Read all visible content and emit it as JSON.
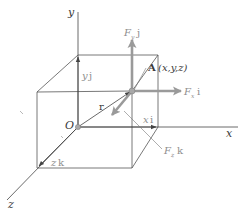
{
  "figure": {
    "axes": {
      "x_label": "x",
      "y_label": "y",
      "z_label": "z",
      "origin_label": "O"
    },
    "vectors": {
      "position_label": "r",
      "x_component": {
        "sym": "x",
        "unit": "i"
      },
      "y_component": {
        "sym": "y",
        "unit": "j"
      },
      "z_component": {
        "sym": "z",
        "unit": "k"
      }
    },
    "forces": {
      "fx": {
        "sym": "F",
        "sub": "x",
        "unit": "i"
      },
      "fy": {
        "sym": "F",
        "sub": "y",
        "unit": "j"
      },
      "fz": {
        "sym": "F",
        "sub": "z",
        "unit": "k"
      }
    },
    "point": {
      "name": "A",
      "coords": "(x,y,z)"
    },
    "colors": {
      "line": "#444444",
      "force_arrow": "#9a9a9a",
      "point_fill": "#a8a8a8"
    }
  }
}
